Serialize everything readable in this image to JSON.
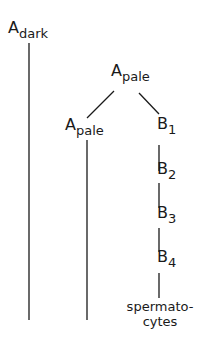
{
  "diagram": {
    "nodes": {
      "a_dark": {
        "main": "A",
        "sub": "dark"
      },
      "a_pale_top": {
        "main": "A",
        "sub": "pale"
      },
      "a_pale_left": {
        "main": "A",
        "sub": "pale"
      },
      "b1": {
        "main": "B",
        "sub": "1"
      },
      "b2": {
        "main": "B",
        "sub": "2"
      },
      "b3": {
        "main": "B",
        "sub": "3"
      },
      "b4": {
        "main": "B",
        "sub": "4"
      },
      "spermatocytes": {
        "line1": "spermato-",
        "line2": "cytes"
      }
    },
    "edges": [
      {
        "from": "a_pale_top",
        "to": "a_pale_left"
      },
      {
        "from": "a_pale_top",
        "to": "b1"
      },
      {
        "from": "b1",
        "to": "b2"
      },
      {
        "from": "b2",
        "to": "b3"
      },
      {
        "from": "b3",
        "to": "b4"
      },
      {
        "from": "b4",
        "to": "spermatocytes"
      }
    ],
    "line_color": "#1a1a1a"
  }
}
